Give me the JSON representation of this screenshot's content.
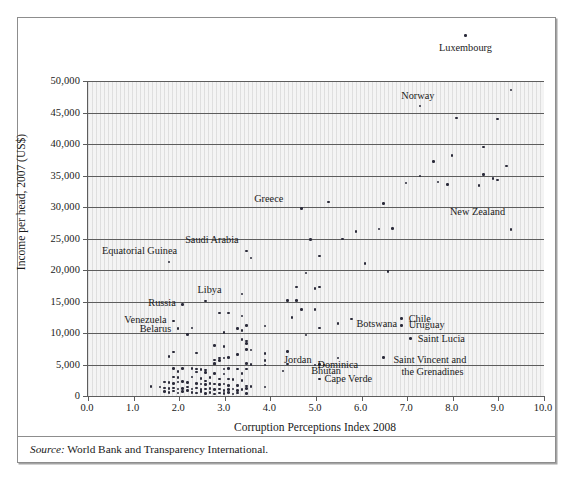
{
  "figure": {
    "source_label": "Source:",
    "source_text": "World Bank and Transparency International."
  },
  "chart_data": {
    "type": "scatter",
    "title": "",
    "xlabel": "Corruption Perceptions Index 2008",
    "ylabel": "Income per head, 2007 (US$)",
    "xlim": [
      0.0,
      10.0
    ],
    "ylim": [
      0,
      50000
    ],
    "xticks": [
      "0.0",
      "1.0",
      "2.0",
      "3.0",
      "4.0",
      "5.0",
      "6.0",
      "7.0",
      "8.0",
      "9.0",
      "10.0"
    ],
    "ytick_values": [
      0,
      5000,
      10000,
      15000,
      20000,
      25000,
      30000,
      35000,
      40000,
      45000,
      50000
    ],
    "yticks": [
      "0",
      "5,000",
      "10,000",
      "15,000",
      "20,000",
      "25,000",
      "30,000",
      "35,000",
      "40,000",
      "45,000",
      "50,000"
    ],
    "grid": "horizontal",
    "legend": "none",
    "point_color": "#2b2b3a",
    "plot_background": "#f4f4f4",
    "axis_color": "#5d5d5d",
    "note": "Point y-values above 50,000 are drawn outside the plot frame, as in the original figure.",
    "labeled_points": [
      {
        "name": "Luxembourg",
        "x": 8.3,
        "y": 57200,
        "label_dx": 0,
        "label_dy": 12,
        "align": "c"
      },
      {
        "name": "Norway",
        "x": 7.3,
        "y": 46000,
        "label_dx": -2,
        "label_dy": -10,
        "align": "c"
      },
      {
        "name": "Greece",
        "x": 4.7,
        "y": 29800,
        "label_dx": -18,
        "label_dy": -9,
        "align": "r"
      },
      {
        "name": "New Zealand",
        "x": 9.3,
        "y": 26400,
        "label_dx": -6,
        "label_dy": -18,
        "align": "r"
      },
      {
        "name": "Saudi Arabia",
        "x": 3.5,
        "y": 23000,
        "label_dx": -8,
        "label_dy": -11,
        "align": "r"
      },
      {
        "name": "Equatorial Guinea",
        "x": 1.8,
        "y": 21300,
        "label_dx": 8,
        "label_dy": -11,
        "align": "r"
      },
      {
        "name": "Libya",
        "x": 2.6,
        "y": 15100,
        "label_dx": 4,
        "label_dy": -11,
        "align": "c"
      },
      {
        "name": "Russia",
        "x": 2.1,
        "y": 14500,
        "label_dx": -7,
        "label_dy": -2,
        "align": "r"
      },
      {
        "name": "Venezuela",
        "x": 1.9,
        "y": 11900,
        "label_dx": -7,
        "label_dy": -1,
        "align": "r"
      },
      {
        "name": "Belarus",
        "x": 2.0,
        "y": 10700,
        "label_dx": -7,
        "label_dy": 0,
        "align": "r"
      },
      {
        "name": "Chile",
        "x": 6.9,
        "y": 12300,
        "label_dx": 7,
        "label_dy": 0,
        "align": "l"
      },
      {
        "name": "Uruguay",
        "x": 6.9,
        "y": 11200,
        "label_dx": 7,
        "label_dy": 0,
        "align": "l"
      },
      {
        "name": "Botswana",
        "x": 5.8,
        "y": 12200,
        "label_dx": 5,
        "label_dy": 5,
        "align": "l"
      },
      {
        "name": "Saint Lucia",
        "x": 7.1,
        "y": 9100,
        "label_dx": 7,
        "label_dy": 0,
        "align": "l"
      },
      {
        "name": "Jordan",
        "x": 5.1,
        "y": 5000,
        "label_dx": -8,
        "label_dy": -5,
        "align": "r"
      },
      {
        "name": "Dominica",
        "x": 5.5,
        "y": 6000,
        "label_dx": 0,
        "label_dy": 7,
        "align": "c"
      },
      {
        "name": "Bhutan",
        "x": 5.2,
        "y": 4900,
        "label_dx": 2,
        "label_dy": 6,
        "align": "c"
      },
      {
        "name": "Cape Verde",
        "x": 5.1,
        "y": 2700,
        "label_dx": 5,
        "label_dy": 0,
        "align": "l"
      },
      {
        "name": "Saint Vincent and",
        "x": 6.5,
        "y": 6100,
        "label_dx": 10,
        "label_dy": 2,
        "align": "l"
      },
      {
        "name": "the Grenadines",
        "x": 6.5,
        "y": 6100,
        "label_dx": 18,
        "label_dy": 14,
        "align": "l"
      }
    ],
    "points": [
      {
        "x": 8.3,
        "y": 57200
      },
      {
        "x": 9.3,
        "y": 48600
      },
      {
        "x": 7.3,
        "y": 46000
      },
      {
        "x": 8.1,
        "y": 44100
      },
      {
        "x": 9.0,
        "y": 44000
      },
      {
        "x": 8.7,
        "y": 39500
      },
      {
        "x": 8.0,
        "y": 38200
      },
      {
        "x": 9.2,
        "y": 36500
      },
      {
        "x": 7.6,
        "y": 37200
      },
      {
        "x": 7.3,
        "y": 34900
      },
      {
        "x": 8.7,
        "y": 35200
      },
      {
        "x": 7.0,
        "y": 33800
      },
      {
        "x": 7.7,
        "y": 34000
      },
      {
        "x": 8.9,
        "y": 34500
      },
      {
        "x": 9.0,
        "y": 34300
      },
      {
        "x": 7.9,
        "y": 33600
      },
      {
        "x": 8.6,
        "y": 33400
      },
      {
        "x": 6.5,
        "y": 30600
      },
      {
        "x": 5.3,
        "y": 30800
      },
      {
        "x": 4.7,
        "y": 29800
      },
      {
        "x": 9.3,
        "y": 26400
      },
      {
        "x": 6.4,
        "y": 26500
      },
      {
        "x": 6.7,
        "y": 26600
      },
      {
        "x": 5.9,
        "y": 26100
      },
      {
        "x": 5.6,
        "y": 24900
      },
      {
        "x": 4.9,
        "y": 24800
      },
      {
        "x": 5.1,
        "y": 22200
      },
      {
        "x": 3.5,
        "y": 23000
      },
      {
        "x": 3.6,
        "y": 21900
      },
      {
        "x": 6.1,
        "y": 21000
      },
      {
        "x": 1.8,
        "y": 21300
      },
      {
        "x": 6.6,
        "y": 19800
      },
      {
        "x": 4.8,
        "y": 19500
      },
      {
        "x": 4.6,
        "y": 17300
      },
      {
        "x": 5.0,
        "y": 17100
      },
      {
        "x": 5.1,
        "y": 17300
      },
      {
        "x": 3.4,
        "y": 16200
      },
      {
        "x": 4.4,
        "y": 15200
      },
      {
        "x": 4.6,
        "y": 15200
      },
      {
        "x": 2.6,
        "y": 15100
      },
      {
        "x": 2.1,
        "y": 14500
      },
      {
        "x": 4.7,
        "y": 13700
      },
      {
        "x": 5.0,
        "y": 13700
      },
      {
        "x": 2.9,
        "y": 13200
      },
      {
        "x": 3.1,
        "y": 13200
      },
      {
        "x": 4.5,
        "y": 12500
      },
      {
        "x": 6.9,
        "y": 12300
      },
      {
        "x": 5.8,
        "y": 12200
      },
      {
        "x": 3.4,
        "y": 12700
      },
      {
        "x": 1.9,
        "y": 11900
      },
      {
        "x": 5.5,
        "y": 11500
      },
      {
        "x": 3.5,
        "y": 11200
      },
      {
        "x": 3.9,
        "y": 11100
      },
      {
        "x": 6.9,
        "y": 11200
      },
      {
        "x": 5.1,
        "y": 10800
      },
      {
        "x": 3.3,
        "y": 10700
      },
      {
        "x": 3.4,
        "y": 10400
      },
      {
        "x": 2.0,
        "y": 10700
      },
      {
        "x": 2.3,
        "y": 10800
      },
      {
        "x": 3.0,
        "y": 10100
      },
      {
        "x": 2.2,
        "y": 9800
      },
      {
        "x": 4.8,
        "y": 9700
      },
      {
        "x": 7.1,
        "y": 9100
      },
      {
        "x": 3.5,
        "y": 8700
      },
      {
        "x": 3.5,
        "y": 8300
      },
      {
        "x": 2.8,
        "y": 8000
      },
      {
        "x": 3.5,
        "y": 7400
      },
      {
        "x": 3.6,
        "y": 7300
      },
      {
        "x": 1.9,
        "y": 7000
      },
      {
        "x": 2.4,
        "y": 6800
      },
      {
        "x": 3.3,
        "y": 6600
      },
      {
        "x": 3.9,
        "y": 6700
      },
      {
        "x": 4.4,
        "y": 7100
      },
      {
        "x": 6.5,
        "y": 6100
      },
      {
        "x": 5.5,
        "y": 6000
      },
      {
        "x": 1.8,
        "y": 6300
      },
      {
        "x": 2.9,
        "y": 6000
      },
      {
        "x": 3.0,
        "y": 6000
      },
      {
        "x": 3.1,
        "y": 6100
      },
      {
        "x": 2.8,
        "y": 5700
      },
      {
        "x": 2.9,
        "y": 5600
      },
      {
        "x": 3.9,
        "y": 5600
      },
      {
        "x": 3.5,
        "y": 5200
      },
      {
        "x": 2.8,
        "y": 5200
      },
      {
        "x": 2.8,
        "y": 5100
      },
      {
        "x": 4.4,
        "y": 5100
      },
      {
        "x": 5.1,
        "y": 5000
      },
      {
        "x": 5.2,
        "y": 4900
      },
      {
        "x": 3.9,
        "y": 4900
      },
      {
        "x": 2.3,
        "y": 4400
      },
      {
        "x": 1.9,
        "y": 4400
      },
      {
        "x": 2.1,
        "y": 4400
      },
      {
        "x": 2.4,
        "y": 4300
      },
      {
        "x": 2.5,
        "y": 4200
      },
      {
        "x": 2.6,
        "y": 4100
      },
      {
        "x": 3.1,
        "y": 4400
      },
      {
        "x": 3.3,
        "y": 4300
      },
      {
        "x": 3.5,
        "y": 4300
      },
      {
        "x": 3.0,
        "y": 4300
      },
      {
        "x": 4.3,
        "y": 4000
      },
      {
        "x": 2.0,
        "y": 3900
      },
      {
        "x": 2.4,
        "y": 3800
      },
      {
        "x": 2.6,
        "y": 3700
      },
      {
        "x": 2.8,
        "y": 3600
      },
      {
        "x": 3.0,
        "y": 3500
      },
      {
        "x": 3.4,
        "y": 3600
      },
      {
        "x": 1.9,
        "y": 3000
      },
      {
        "x": 2.0,
        "y": 2900
      },
      {
        "x": 2.3,
        "y": 3000
      },
      {
        "x": 2.5,
        "y": 2800
      },
      {
        "x": 2.7,
        "y": 2900
      },
      {
        "x": 2.9,
        "y": 2700
      },
      {
        "x": 3.1,
        "y": 2700
      },
      {
        "x": 3.2,
        "y": 2600
      },
      {
        "x": 3.4,
        "y": 2500
      },
      {
        "x": 5.1,
        "y": 2700
      },
      {
        "x": 1.7,
        "y": 2200
      },
      {
        "x": 1.8,
        "y": 2100
      },
      {
        "x": 1.9,
        "y": 2000
      },
      {
        "x": 2.0,
        "y": 2200
      },
      {
        "x": 2.1,
        "y": 2300
      },
      {
        "x": 2.2,
        "y": 2100
      },
      {
        "x": 2.4,
        "y": 2000
      },
      {
        "x": 2.5,
        "y": 1900
      },
      {
        "x": 2.6,
        "y": 1800
      },
      {
        "x": 2.7,
        "y": 2000
      },
      {
        "x": 2.8,
        "y": 1900
      },
      {
        "x": 2.9,
        "y": 1800
      },
      {
        "x": 3.0,
        "y": 1900
      },
      {
        "x": 3.1,
        "y": 1700
      },
      {
        "x": 3.3,
        "y": 1700
      },
      {
        "x": 3.5,
        "y": 1600
      },
      {
        "x": 3.6,
        "y": 1500
      },
      {
        "x": 3.9,
        "y": 1400
      },
      {
        "x": 1.4,
        "y": 1500
      },
      {
        "x": 1.6,
        "y": 1400
      },
      {
        "x": 1.7,
        "y": 1300
      },
      {
        "x": 1.8,
        "y": 1200
      },
      {
        "x": 1.9,
        "y": 1300
      },
      {
        "x": 2.0,
        "y": 1100
      },
      {
        "x": 2.1,
        "y": 1200
      },
      {
        "x": 2.2,
        "y": 1400
      },
      {
        "x": 2.3,
        "y": 1100
      },
      {
        "x": 2.4,
        "y": 1300
      },
      {
        "x": 2.5,
        "y": 1000
      },
      {
        "x": 2.6,
        "y": 1100
      },
      {
        "x": 2.7,
        "y": 1200
      },
      {
        "x": 2.8,
        "y": 1000
      },
      {
        "x": 2.9,
        "y": 1100
      },
      {
        "x": 3.0,
        "y": 900
      },
      {
        "x": 3.1,
        "y": 1000
      },
      {
        "x": 3.2,
        "y": 1100
      },
      {
        "x": 3.3,
        "y": 900
      },
      {
        "x": 3.4,
        "y": 1000
      },
      {
        "x": 3.5,
        "y": 1200
      },
      {
        "x": 1.7,
        "y": 700
      },
      {
        "x": 1.8,
        "y": 600
      },
      {
        "x": 1.9,
        "y": 800
      },
      {
        "x": 2.0,
        "y": 500
      },
      {
        "x": 2.1,
        "y": 700
      },
      {
        "x": 2.3,
        "y": 600
      },
      {
        "x": 2.4,
        "y": 500
      },
      {
        "x": 2.5,
        "y": 700
      },
      {
        "x": 2.6,
        "y": 400
      },
      {
        "x": 2.7,
        "y": 600
      },
      {
        "x": 2.8,
        "y": 300
      },
      {
        "x": 2.9,
        "y": 500
      },
      {
        "x": 3.0,
        "y": 400
      },
      {
        "x": 3.1,
        "y": 600
      },
      {
        "x": 3.2,
        "y": 300
      },
      {
        "x": 3.3,
        "y": 500
      },
      {
        "x": 3.5,
        "y": 400
      },
      {
        "x": 2.2,
        "y": 900
      },
      {
        "x": 2.6,
        "y": 2400
      },
      {
        "x": 3.0,
        "y": 7900
      },
      {
        "x": 3.4,
        "y": 9000
      },
      {
        "x": 3.6,
        "y": 5000
      },
      {
        "x": 5.0,
        "y": 4950
      }
    ]
  }
}
